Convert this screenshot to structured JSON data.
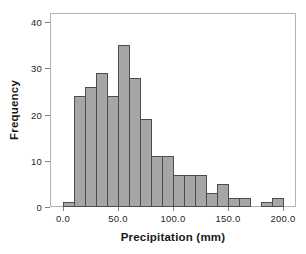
{
  "figure": {
    "background": "#ffffff"
  },
  "chart_data": {
    "type": "bar",
    "subtype": "histogram",
    "title": "",
    "xlabel": "Precipitation (mm)",
    "ylabel": "Frequency",
    "bin_start": 0,
    "bin_width": 10,
    "bin_edges": [
      0,
      10,
      20,
      30,
      40,
      50,
      60,
      70,
      80,
      90,
      100,
      110,
      120,
      130,
      140,
      150,
      160,
      170,
      180,
      190,
      200
    ],
    "values": [
      1,
      24,
      26,
      29,
      24,
      35,
      28,
      19,
      11,
      11,
      7,
      7,
      7,
      3,
      5,
      2,
      2,
      0,
      1,
      2
    ],
    "x_tick_values": [
      0,
      50,
      100,
      150,
      200
    ],
    "x_tick_labels": [
      "0.0",
      "50.0",
      "100.0",
      "150.0",
      "200.0"
    ],
    "y_tick_values": [
      0,
      10,
      20,
      30,
      40
    ],
    "y_tick_labels": [
      "0",
      "10",
      "20",
      "30",
      "40"
    ],
    "xlim": [
      -12,
      212
    ],
    "ylim": [
      0,
      42
    ],
    "grid": false,
    "legend": "none",
    "colors": {
      "bar_fill": "#a6a6a6",
      "bar_border": "#4d4d4d",
      "frame": "#b3b3b3",
      "tick": "#808080",
      "text": "#262626"
    }
  }
}
